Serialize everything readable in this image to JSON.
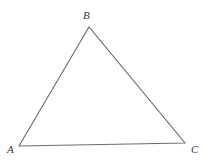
{
  "figure": {
    "name": "triangle-abc",
    "kind": "geometry-diagram",
    "background_color": "#ffffff",
    "stroke_color": "#6b6b6b",
    "stroke_width": 1.1,
    "label_color": "#3a3a3a",
    "canvas": {
      "width": 209,
      "height": 163
    },
    "vertices": [
      {
        "id": "A",
        "label": "A",
        "x": 19,
        "y": 146,
        "label_x": 7,
        "label_y": 144
      },
      {
        "id": "B",
        "label": "B",
        "x": 89,
        "y": 27,
        "label_x": 83,
        "label_y": 10
      },
      {
        "id": "C",
        "label": "C",
        "x": 185,
        "y": 143,
        "label_x": 191,
        "label_y": 144
      }
    ],
    "edges": [
      {
        "id": "AB",
        "from": "A",
        "to": "B"
      },
      {
        "id": "BC",
        "from": "B",
        "to": "C"
      },
      {
        "id": "CA",
        "from": "C",
        "to": "A"
      }
    ],
    "polygon_points": "19,146 89,27 185,143"
  }
}
